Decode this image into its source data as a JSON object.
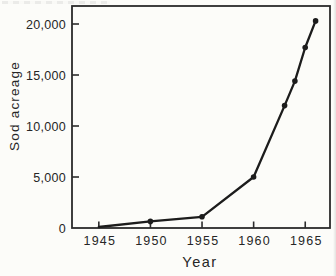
{
  "chart_data": {
    "type": "line",
    "title": "",
    "xlabel": "Year",
    "ylabel": "Sod acreage",
    "x": [
      1945,
      1950,
      1955,
      1960,
      1963,
      1964,
      1965,
      1966
    ],
    "values": [
      100,
      650,
      1100,
      5000,
      12000,
      14400,
      17700,
      20300
    ],
    "series_name": "Sod acreage",
    "x_ticks": [
      {
        "value": 1945,
        "label": "1945"
      },
      {
        "value": 1950,
        "label": "1950"
      },
      {
        "value": 1955,
        "label": "1955"
      },
      {
        "value": 1960,
        "label": "1960"
      },
      {
        "value": 1965,
        "label": "1965"
      }
    ],
    "y_ticks": [
      {
        "value": 0,
        "label": "0"
      },
      {
        "value": 5000,
        "label": "5,000"
      },
      {
        "value": 10000,
        "label": "10,000"
      },
      {
        "value": 15000,
        "label": "15,000"
      },
      {
        "value": 20000,
        "label": "20,000"
      }
    ],
    "xlim": [
      1942.4,
      1967.4
    ],
    "ylim": [
      0,
      21765
    ],
    "grid": false,
    "frame": "box",
    "legend": "none",
    "marker": "circle",
    "line_color": "#1c1c1c",
    "marker_color": "#1c1c1c",
    "axis_color": "#2b2b2b",
    "text_color": "#262626",
    "background_color": "#fcfcf9"
  }
}
